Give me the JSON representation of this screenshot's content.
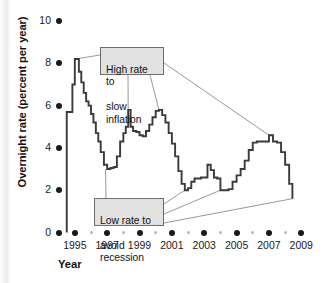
{
  "chart_data": {
    "type": "line",
    "title": "",
    "xlabel": "Year",
    "ylabel": "Overnight rate (percent per year)",
    "xlim": [
      1994.3,
      2009.6
    ],
    "ylim": [
      0,
      10
    ],
    "yticks": [
      0,
      2,
      4,
      6,
      8,
      10
    ],
    "ytick_labels": [
      "0",
      "2",
      "4",
      "6",
      "8",
      "10"
    ],
    "xticks": [
      1995,
      1997,
      1999,
      2001,
      2003,
      2005,
      2007,
      2009
    ],
    "xtick_labels": [
      "1995",
      "1997",
      "1999",
      "2001",
      "2003",
      "2005",
      "2007",
      "2009"
    ],
    "xticks_minor": [
      1996,
      1998,
      2000,
      2002,
      2004,
      2006,
      2008
    ],
    "grid": false,
    "legend": null,
    "series": [
      {
        "name": "Overnight rate",
        "color": "#3a3a3a",
        "step": true,
        "x": [
          1994.5,
          1994.7,
          1994.85,
          1995.0,
          1995.1,
          1995.25,
          1995.4,
          1995.55,
          1995.7,
          1995.85,
          1996.0,
          1996.15,
          1996.3,
          1996.45,
          1996.6,
          1996.8,
          1997.0,
          1997.2,
          1997.4,
          1997.6,
          1997.8,
          1998.0,
          1998.15,
          1998.3,
          1998.45,
          1998.6,
          1998.8,
          1999.0,
          1999.2,
          1999.4,
          1999.6,
          1999.8,
          2000.0,
          2000.2,
          2000.4,
          2000.6,
          2000.8,
          2001.0,
          2001.2,
          2001.4,
          2001.6,
          2001.8,
          2002.0,
          2002.2,
          2002.4,
          2002.6,
          2002.8,
          2003.0,
          2003.2,
          2003.4,
          2003.6,
          2003.8,
          2004.0,
          2004.25,
          2004.5,
          2004.75,
          2005.0,
          2005.25,
          2005.5,
          2005.75,
          2006.0,
          2006.25,
          2006.5,
          2006.75,
          2007.0,
          2007.25,
          2007.5,
          2007.75,
          2008.0,
          2008.25,
          2008.45
        ],
        "y": [
          5.7,
          5.7,
          7.0,
          8.2,
          8.2,
          7.6,
          7.1,
          6.6,
          6.2,
          6.0,
          5.6,
          5.2,
          4.7,
          4.3,
          3.8,
          3.2,
          3.0,
          3.05,
          3.1,
          3.6,
          4.3,
          4.7,
          5.0,
          5.8,
          5.0,
          4.8,
          4.75,
          4.6,
          4.55,
          4.8,
          5.1,
          5.45,
          5.75,
          5.8,
          5.55,
          5.2,
          4.7,
          4.2,
          3.6,
          2.9,
          2.3,
          2.0,
          2.1,
          2.4,
          2.55,
          2.55,
          2.6,
          2.6,
          3.2,
          2.95,
          2.6,
          2.55,
          2.0,
          2.0,
          2.05,
          2.4,
          2.7,
          3.0,
          3.4,
          3.9,
          4.25,
          4.3,
          4.3,
          4.3,
          4.6,
          4.3,
          4.25,
          3.8,
          3.2,
          2.3,
          1.6
        ]
      }
    ],
    "annotations": [
      {
        "id": "high-rate",
        "text": "High rate to\nslow inflation",
        "line1": "High rate to",
        "line2": "slow inflation",
        "points_to": [
          {
            "x": 1995.0,
            "y": 8.2
          },
          {
            "x": 1998.3,
            "y": 5.8
          },
          {
            "x": 2000.2,
            "y": 5.8
          },
          {
            "x": 2007.0,
            "y": 4.6
          }
        ]
      },
      {
        "id": "low-rate",
        "text": "Low rate to\navoid recession",
        "line1": "Low rate to",
        "line2": "avoid recession",
        "points_to": [
          {
            "x": 1996.9,
            "y": 3.0
          },
          {
            "x": 2001.8,
            "y": 2.0
          },
          {
            "x": 2004.0,
            "y": 2.0
          },
          {
            "x": 2008.45,
            "y": 1.6
          }
        ]
      }
    ]
  },
  "axis": {
    "y_title": "Overnight rate (percent per year)",
    "x_title": "Year"
  },
  "colors": {
    "line": "#3a3a3a",
    "callout_fill": "#e2e2e2",
    "callout_border": "#6d6d6d",
    "tick_major": "#1a1a1a",
    "tick_minor": "#b8b8b8",
    "text": "#111111"
  }
}
